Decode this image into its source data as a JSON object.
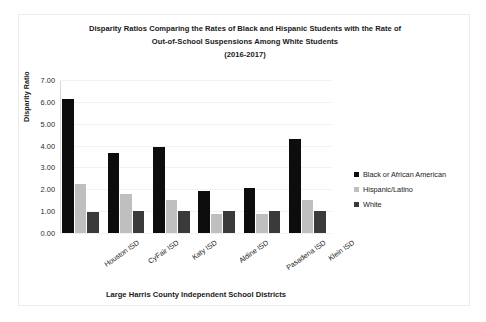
{
  "chart_data": {
    "type": "bar",
    "title": "Disparity Ratios Comparing the Rates of Black and Hispanic Students with the Rate of Out-of-School Suspensions Among White Students (2016-2017)",
    "title_lines": [
      "Disparity Ratios Comparing the Rates of Black and Hispanic Students with the Rate of",
      "Out-of-School Suspensions Among White Students",
      "(2016-2017)"
    ],
    "xlabel": "Large Harris County Independent School Districts",
    "ylabel": "Disparity Ratio",
    "ylim": [
      0,
      7
    ],
    "ytick_labels": [
      "0.00",
      "1.00",
      "2.00",
      "3.00",
      "4.00",
      "5.00",
      "6.00",
      "7.00"
    ],
    "ytick_values": [
      0,
      1,
      2,
      3,
      4,
      5,
      6,
      7
    ],
    "grid": true,
    "legend_position": "right",
    "categories": [
      "Houston ISD",
      "CyFair ISD",
      "Katy ISD",
      "Aldine ISD",
      "Pasadena ISD",
      "Klein ISD"
    ],
    "series": [
      {
        "name": "Black or African American",
        "color": "#0d0d0d",
        "values": [
          6.15,
          3.65,
          3.95,
          1.9,
          2.05,
          4.3
        ]
      },
      {
        "name": "Hispanic/Latino",
        "color": "#bfbfbf",
        "values": [
          2.25,
          1.8,
          1.5,
          0.85,
          0.85,
          1.5
        ]
      },
      {
        "name": "White",
        "color": "#3a3a3a",
        "values": [
          0.95,
          1.0,
          1.0,
          1.0,
          1.0,
          1.0
        ]
      }
    ]
  }
}
